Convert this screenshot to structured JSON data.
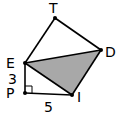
{
  "diagram": {
    "points": {
      "T": {
        "label": "T",
        "x": 55,
        "y": 18
      },
      "D": {
        "label": "D",
        "x": 101,
        "y": 50
      },
      "E": {
        "label": "E",
        "x": 25,
        "y": 63
      },
      "P": {
        "label": "P",
        "x": 25,
        "y": 93
      },
      "I": {
        "label": "I",
        "x": 72,
        "y": 95
      }
    },
    "segments": [
      [
        "T",
        "D"
      ],
      [
        "T",
        "E"
      ],
      [
        "E",
        "D"
      ],
      [
        "D",
        "I"
      ],
      [
        "E",
        "I"
      ],
      [
        "E",
        "P"
      ],
      [
        "P",
        "I"
      ]
    ],
    "shaded_triangle": [
      "E",
      "D",
      "I"
    ],
    "shade_color": "#a8a8a8",
    "line_color": "#000000",
    "right_angle_at": "P",
    "measures": {
      "EP": "3",
      "PI": "5"
    }
  }
}
